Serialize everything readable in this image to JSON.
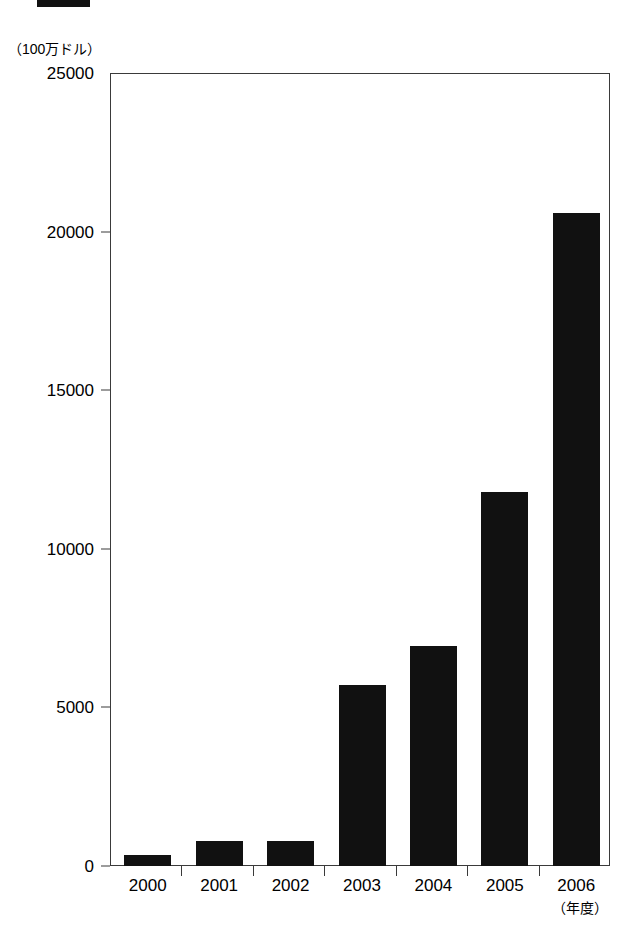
{
  "page": {
    "background_color": "#ffffff",
    "ink_color": "#111111",
    "axis_color": "#3a3a3a"
  },
  "header_strip": {
    "name": "cropped-black-strip",
    "color": "#111111"
  },
  "chart_data": {
    "type": "bar",
    "title": "",
    "subtitle": "",
    "xlabel": "（年度）",
    "ylabel": "（100万ドル）",
    "categories": [
      "2000",
      "2001",
      "2002",
      "2003",
      "2004",
      "2005",
      "2006"
    ],
    "values": [
      350,
      790,
      800,
      5700,
      6950,
      11800,
      20600
    ],
    "series": [
      {
        "name": "金額",
        "values": [
          350,
          790,
          800,
          5700,
          6950,
          11800,
          20600
        ],
        "color": "#111111"
      }
    ],
    "ylim": [
      0,
      25000
    ],
    "yticks": [
      0,
      5000,
      10000,
      15000,
      20000,
      25000
    ],
    "ytick_labels": [
      "0",
      "5000",
      "10000",
      "15000",
      "20000",
      "25000"
    ],
    "grid": false,
    "legend": false,
    "legend_position": "none",
    "annotations": []
  }
}
